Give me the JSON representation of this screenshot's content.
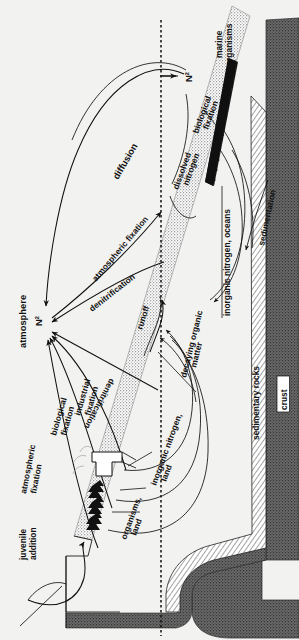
{
  "figure": {
    "orientation": "rotated-90-ccw",
    "background_color": "#f2f2f0",
    "ink_color": "#111111"
  },
  "reservoirs": {
    "atmosphere": "atmosphere",
    "n2_atmospheric": "N",
    "n2_atmospheric_sub": "2",
    "n2_marine": "N",
    "n2_marine_sub": "2",
    "dissolved_nitrogen": "dissolved\nnitrogen",
    "dissolved_nitrogen_l1": "dissolved",
    "dissolved_nitrogen_l2": "nitrogen",
    "marine_organisms_l1": "marine",
    "marine_organisms_l2": "organisms",
    "inorganic_nitrogen_oceans": "inorganic nitrogen, oceans",
    "inorganic_nitrogen_land_l1": "inorganic nitrogen,",
    "inorganic_nitrogen_land_l2": "land",
    "organisms_land_l1": "organisms,",
    "organisms_land_l2": "land",
    "sedimentary_rocks": "sedimentary rocks",
    "crust": "crust"
  },
  "fluxes": {
    "diffusion": "diffusion",
    "atmospheric_fixation_ocean": "atmospheric fixation",
    "denitrification_ocean": "denitrification",
    "denitrification_land": "denitrification",
    "industrial_fixation_l1": "industrial",
    "industrial_fixation_l2": "fixation",
    "biological_fixation_land_l1": "biological",
    "biological_fixation_land_l2": "fixation",
    "atmospheric_fixation_land_l1": "atmospheric",
    "atmospheric_fixation_land_l2": "fixation",
    "biological_fixation_marine_l1": "biological",
    "biological_fixation_marine_l2": "fixation",
    "juvenile_addition_l1": "juvenile",
    "juvenile_addition_l2": "addition",
    "runoff": "runoff",
    "decaying_organic_matter_l1": "decaying organic",
    "decaying_organic_matter_l2": "matter",
    "sedimentation": "sedimentation"
  },
  "icons": {
    "factory": "factory-icon",
    "trees": "trees-icon",
    "sea_surface": "dotted-sea-surface-line"
  }
}
